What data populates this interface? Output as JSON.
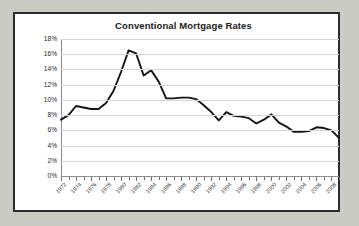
{
  "chart_data": {
    "type": "line",
    "title": "Conventional Mortgage Rates",
    "xlabel": "",
    "ylabel": "",
    "ylim": [
      0,
      18
    ],
    "ytick_step": 2,
    "ytick_labels": [
      "0%",
      "2%",
      "4%",
      "6%",
      "8%",
      "10%",
      "12%",
      "14%",
      "16%",
      "18%"
    ],
    "ytick_values": [
      0,
      2,
      4,
      6,
      8,
      10,
      12,
      14,
      16,
      18
    ],
    "xlim": [
      1972,
      2009
    ],
    "xtick_label_step": 2,
    "xtick_labels": [
      "1972",
      "1974",
      "1976",
      "1978",
      "1980",
      "1982",
      "1984",
      "1986",
      "1988",
      "1990",
      "1992",
      "1994",
      "1996",
      "1998",
      "2000",
      "2002",
      "2004",
      "2006",
      "2008"
    ],
    "grid": true,
    "legend": "none",
    "series": [
      {
        "name": "Conventional Mortgage Rate",
        "color": "#141414",
        "x": [
          1972,
          1973,
          1974,
          1975,
          1976,
          1977,
          1978,
          1979,
          1980,
          1981,
          1982,
          1983,
          1984,
          1985,
          1986,
          1987,
          1988,
          1989,
          1990,
          1991,
          1992,
          1993,
          1994,
          1995,
          1996,
          1997,
          1998,
          1999,
          2000,
          2001,
          2002,
          2003,
          2004,
          2005,
          2006,
          2007,
          2008,
          2009
        ],
        "values": [
          7.4,
          8.0,
          9.2,
          9.0,
          8.8,
          8.8,
          9.6,
          11.2,
          13.7,
          16.5,
          16.1,
          13.2,
          13.9,
          12.4,
          10.2,
          10.2,
          10.3,
          10.3,
          10.1,
          9.3,
          8.4,
          7.3,
          8.4,
          7.9,
          7.8,
          7.6,
          6.9,
          7.4,
          8.1,
          7.0,
          6.5,
          5.8,
          5.8,
          5.9,
          6.4,
          6.3,
          6.0,
          5.0
        ]
      }
    ]
  },
  "frame": {
    "border_color": "#2b2b2b",
    "background": "#ffffff",
    "page_background": "#cbcbc6"
  }
}
